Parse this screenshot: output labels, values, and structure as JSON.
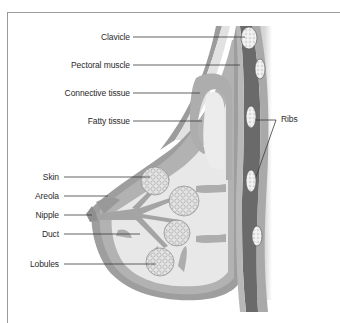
{
  "diagram": {
    "type": "anatomical cross-section",
    "labels_left_upper": [
      {
        "id": "clavicle",
        "text": "Clavicle"
      },
      {
        "id": "pectoral-muscle",
        "text": "Pectoral muscle"
      },
      {
        "id": "connective-tissue",
        "text": "Connective tissue"
      },
      {
        "id": "fatty-tissue",
        "text": "Fatty tissue"
      }
    ],
    "labels_left_lower": [
      {
        "id": "skin",
        "text": "Skin"
      },
      {
        "id": "areola",
        "text": "Areola"
      },
      {
        "id": "nipple",
        "text": "Nipple"
      },
      {
        "id": "duct",
        "text": "Duct"
      },
      {
        "id": "lobules",
        "text": "Lobules"
      }
    ],
    "labels_right": [
      {
        "id": "ribs",
        "text": "Ribs"
      }
    ],
    "colors": {
      "skin_outline": "#9c9c9c",
      "skin_fill": "#e6e6e6",
      "connective": "#a8a8a8",
      "fatty": "#e9e9e9",
      "muscle": "#6e6e6e",
      "chest_wall": "#b4b4b4",
      "rib": "#f2f2f2",
      "leader_line": "#3a3a3a",
      "frame": "#9a9a9a"
    }
  }
}
